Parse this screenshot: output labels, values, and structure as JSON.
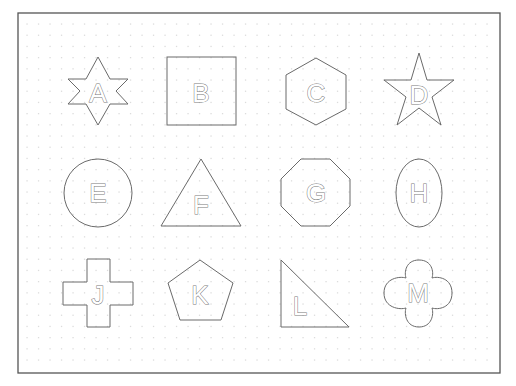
{
  "worksheet": {
    "frame": {
      "x": 18,
      "y": 13,
      "width": 482,
      "height": 360
    },
    "grid": {
      "x0": 27,
      "y0": 24,
      "dx": 11.5,
      "dy": 11.2,
      "cols": 42,
      "rows": 32
    },
    "shapes": [
      {
        "letter": "A",
        "type": "six-point-star",
        "cx": 98,
        "cy": 91
      },
      {
        "letter": "B",
        "type": "square",
        "cx": 201,
        "cy": 91
      },
      {
        "letter": "C",
        "type": "hexagon",
        "cx": 316,
        "cy": 92
      },
      {
        "letter": "D",
        "type": "five-point-star",
        "cx": 419,
        "cy": 92
      },
      {
        "letter": "E",
        "type": "circle",
        "cx": 98,
        "cy": 193
      },
      {
        "letter": "F",
        "type": "triangle",
        "cx": 201,
        "cy": 193
      },
      {
        "letter": "G",
        "type": "octagon",
        "cx": 316,
        "cy": 193
      },
      {
        "letter": "H",
        "type": "ellipse",
        "cx": 419,
        "cy": 193
      },
      {
        "letter": "J",
        "type": "cross",
        "cx": 98,
        "cy": 293
      },
      {
        "letter": "K",
        "type": "pentagon",
        "cx": 201,
        "cy": 293
      },
      {
        "letter": "L",
        "type": "right-triangle",
        "cx": 316,
        "cy": 293
      },
      {
        "letter": "M",
        "type": "rounded-cross",
        "cx": 419,
        "cy": 293
      }
    ]
  }
}
